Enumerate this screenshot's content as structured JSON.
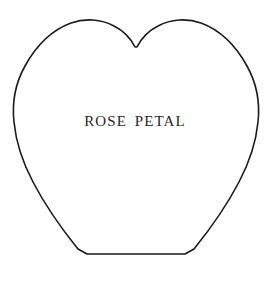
{
  "figure": {
    "kind": "sewing-pattern-template",
    "background_color": "#ffffff",
    "outline_color": "#1a1a1a",
    "fill_color": "#ffffff",
    "label": "ROSE PETAL",
    "label_color": "#262626",
    "shape_name": "rose-petal-outline",
    "geometry": {
      "viewbox": "0 0 270 282",
      "path": "M 135 47 C 131 39 124 31 114 26 C 101 19 85 18 71 23 C 52 30 36 46 25 66 C 15 84 12 104 14 122 C 16 143 23 163 33 182 C 44 203 61 228 78 249 L 87 254 L 185 254 L 194 249 C 211 228 228 203 239 182 C 249 163 256 143 258 122 C 260 104 257 84 247 66 C 236 46 220 30 201 23 C 187 18 171 19 158 26 C 148 31 141 39 137 47 Z",
      "description": "Heart-like petal with a shallow notch at the top centre, two rounded upper lobes, curved sides tapering inward to a flat horizontal base."
    },
    "anchors": {
      "top_notch": [
        135,
        47
      ],
      "left_lobe_peak": [
        90,
        25
      ],
      "right_lobe_peak": [
        190,
        25
      ],
      "widest_left": [
        13,
        118
      ],
      "widest_right": [
        256,
        118
      ],
      "base_left": [
        87,
        254
      ],
      "base_right": [
        185,
        254
      ]
    }
  }
}
